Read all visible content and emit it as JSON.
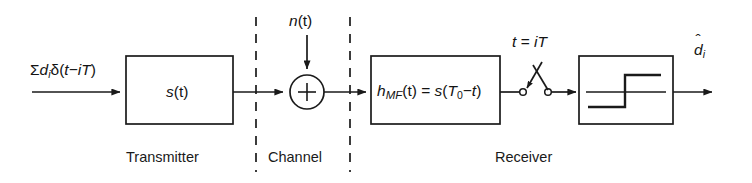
{
  "figure": {
    "type": "block-diagram",
    "background": "#ffffff",
    "line_color": "#1a1a1a"
  },
  "signals": {
    "input_label": "Σdᵢδ(t−iT)",
    "input_sigma": "Σ",
    "input_d": "d",
    "input_sub_i": "i",
    "input_delta": "δ(",
    "input_t": "t",
    "input_minus": "−",
    "input_i": "i",
    "input_T": "T",
    "input_close": ")",
    "noise_label": "n(t)",
    "noise_n": "n",
    "noise_rest": "(t)",
    "sampling_label": "t = iT",
    "sampling_t": "t",
    "sampling_eq": "=",
    "sampling_iT": "iT",
    "output_label": "d̂ᵢ",
    "output_d": "d",
    "output_hat": "ˆ",
    "output_sub_i": "i"
  },
  "blocks": [
    {
      "id": "transmitter-filter",
      "label": "s(t)",
      "label_s": "s",
      "label_rest": "(t)"
    },
    {
      "id": "matched-filter",
      "label": "h_MF(t) = s(T_0−t)",
      "h": "h",
      "mf": "MF",
      "mid": "(t) = ",
      "s": "s",
      "open": "(",
      "T": "T",
      "zero": "0",
      "minus": "−",
      "t": "t",
      "close": ")"
    },
    {
      "id": "decision-device",
      "label": "sgn",
      "glyph": "step-function"
    }
  ],
  "operators": {
    "summing_junction": "+"
  },
  "sections": [
    {
      "id": "transmitter",
      "label": "Transmitter"
    },
    {
      "id": "channel",
      "label": "Channel"
    },
    {
      "id": "receiver",
      "label": "Receiver"
    }
  ]
}
